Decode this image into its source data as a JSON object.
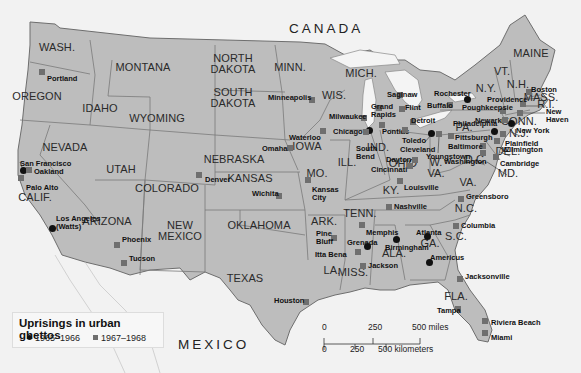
{
  "map": {
    "countries": {
      "canada": "CANADA",
      "mexico": "MEXICO"
    },
    "states": [
      {
        "id": "wash",
        "label": "WASH.",
        "x": 57,
        "y": 47
      },
      {
        "id": "oregon",
        "label": "OREGON",
        "x": 37,
        "y": 96
      },
      {
        "id": "idaho",
        "label": "IDAHO",
        "x": 100,
        "y": 108
      },
      {
        "id": "montana",
        "label": "MONTANA",
        "x": 143,
        "y": 67
      },
      {
        "id": "wyoming",
        "label": "WYOMING",
        "x": 157,
        "y": 118
      },
      {
        "id": "north-dakota",
        "label": "NORTH\nDAKOTA",
        "x": 233,
        "y": 64
      },
      {
        "id": "south-dakota",
        "label": "SOUTH\nDAKOTA",
        "x": 233,
        "y": 98
      },
      {
        "id": "minn",
        "label": "MINN.",
        "x": 290,
        "y": 67
      },
      {
        "id": "wis",
        "label": "WIS.",
        "x": 334,
        "y": 95
      },
      {
        "id": "mich",
        "label": "MICH.",
        "x": 361,
        "y": 73
      },
      {
        "id": "nevada",
        "label": "NEVADA",
        "x": 65,
        "y": 147
      },
      {
        "id": "utah",
        "label": "UTAH",
        "x": 121,
        "y": 169
      },
      {
        "id": "colorado",
        "label": "COLORADO",
        "x": 167,
        "y": 188
      },
      {
        "id": "nebraska",
        "label": "NEBRASKA",
        "x": 234,
        "y": 159
      },
      {
        "id": "iowa",
        "label": "IOWA",
        "x": 307,
        "y": 146
      },
      {
        "id": "kansas",
        "label": "KANSAS",
        "x": 250,
        "y": 178
      },
      {
        "id": "mo",
        "label": "MO.",
        "x": 317,
        "y": 173
      },
      {
        "id": "ill",
        "label": "ILL.",
        "x": 347,
        "y": 162
      },
      {
        "id": "ind",
        "label": "IND.",
        "x": 378,
        "y": 147
      },
      {
        "id": "ohio",
        "label": "OHIO",
        "x": 403,
        "y": 163
      },
      {
        "id": "calif",
        "label": "CALIF.",
        "x": 35,
        "y": 197
      },
      {
        "id": "arizona",
        "label": "ARIZONA",
        "x": 107,
        "y": 221
      },
      {
        "id": "new-mexico",
        "label": "NEW\nMEXICO",
        "x": 180,
        "y": 231
      },
      {
        "id": "oklahoma",
        "label": "OKLAHOMA",
        "x": 259,
        "y": 225
      },
      {
        "id": "texas",
        "label": "TEXAS",
        "x": 245,
        "y": 278
      },
      {
        "id": "ark",
        "label": "ARK.",
        "x": 324,
        "y": 221
      },
      {
        "id": "la",
        "label": "LA.",
        "x": 332,
        "y": 270
      },
      {
        "id": "miss",
        "label": "MISS.",
        "x": 353,
        "y": 272
      },
      {
        "id": "tenn",
        "label": "TENN.",
        "x": 360,
        "y": 213
      },
      {
        "id": "ala",
        "label": "ALA.",
        "x": 394,
        "y": 253
      },
      {
        "id": "ga",
        "label": "GA.",
        "x": 430,
        "y": 243
      },
      {
        "id": "ky",
        "label": "KY.",
        "x": 391,
        "y": 190
      },
      {
        "id": "w-va",
        "label": "W.\nVA.",
        "x": 436,
        "y": 168
      },
      {
        "id": "va",
        "label": "VA.",
        "x": 468,
        "y": 182
      },
      {
        "id": "nc",
        "label": "N.C.",
        "x": 466,
        "y": 208
      },
      {
        "id": "sc",
        "label": "S.C.",
        "x": 456,
        "y": 236
      },
      {
        "id": "fla",
        "label": "FLA.",
        "x": 456,
        "y": 296
      },
      {
        "id": "pa",
        "label": "PA.",
        "x": 464,
        "y": 127
      },
      {
        "id": "ny",
        "label": "N.Y.",
        "x": 486,
        "y": 88
      },
      {
        "id": "vt",
        "label": "VT.",
        "x": 502,
        "y": 71
      },
      {
        "id": "nh",
        "label": "N.H.",
        "x": 518,
        "y": 84
      },
      {
        "id": "maine",
        "label": "MAINE",
        "x": 531,
        "y": 53
      },
      {
        "id": "mass",
        "label": "MASS.",
        "x": 541,
        "y": 97
      },
      {
        "id": "ri",
        "label": "R.I.",
        "x": 546,
        "y": 104
      },
      {
        "id": "conn",
        "label": "CONN.",
        "x": 519,
        "y": 121
      },
      {
        "id": "nj",
        "label": "N.J.",
        "x": 519,
        "y": 133
      },
      {
        "id": "del",
        "label": "DEL.",
        "x": 508,
        "y": 151
      },
      {
        "id": "md",
        "label": "MD.",
        "x": 508,
        "y": 173
      },
      {
        "id": "dc",
        "label": "D.C.",
        "x": 476,
        "y": 159
      }
    ],
    "cities": [
      {
        "name": "Portland",
        "period": "1967-1968",
        "mx": 42,
        "my": 72,
        "lx": 47,
        "ly": 75
      },
      {
        "name": "San Francisco",
        "period": "1965-1966",
        "mx": 23,
        "my": 170,
        "lx": 20,
        "ly": 160
      },
      {
        "name": "Oakland",
        "period": "1967-1968",
        "mx": 29,
        "my": 170,
        "lx": 34,
        "ly": 168
      },
      {
        "name": "Palo Alto",
        "period": "1967-1968",
        "mx": 21,
        "my": 178,
        "lx": 26,
        "ly": 184
      },
      {
        "name": "Los Angeles\n(Watts)",
        "period": "1965-1966",
        "mx": 52,
        "my": 228,
        "lx": 56,
        "ly": 215
      },
      {
        "name": "Phoenix",
        "period": "1967-1968",
        "mx": 117,
        "my": 245,
        "lx": 122,
        "ly": 236
      },
      {
        "name": "Tucson",
        "period": "1967-1968",
        "mx": 124,
        "my": 263,
        "lx": 129,
        "ly": 255
      },
      {
        "name": "Denver",
        "period": "1967-1968",
        "mx": 199,
        "my": 175,
        "lx": 205,
        "ly": 176
      },
      {
        "name": "Wichita",
        "period": "1967-1968",
        "mx": 279,
        "my": 196,
        "lx": 252,
        "ly": 190
      },
      {
        "name": "Omaha",
        "period": "1967-1968",
        "mx": 290,
        "my": 148,
        "lx": 262,
        "ly": 145
      },
      {
        "name": "Waterloo",
        "period": "1967-1968",
        "mx": 323,
        "my": 131,
        "lx": 289,
        "ly": 134
      },
      {
        "name": "Kansas\nCity",
        "period": "1967-1968",
        "mx": 308,
        "my": 180,
        "lx": 312,
        "ly": 186
      },
      {
        "name": "Minneapolis",
        "period": "1967-1968",
        "mx": 312,
        "my": 100,
        "lx": 268,
        "ly": 94
      },
      {
        "name": "Milwaukee",
        "period": "1967-1968",
        "mx": 364,
        "my": 118,
        "lx": 329,
        "ly": 113
      },
      {
        "name": "Chicago",
        "period": "1965-1966",
        "mx": 369,
        "my": 130,
        "lx": 333,
        "ly": 128
      },
      {
        "name": "South\nBend",
        "period": "1967-1968",
        "mx": 366,
        "my": 132,
        "lx": 356,
        "ly": 145
      },
      {
        "name": "Grand\nRapids",
        "period": "1967-1968",
        "mx": 379,
        "my": 108,
        "lx": 371,
        "ly": 103
      },
      {
        "name": "Saginaw",
        "period": "1967-1968",
        "mx": 400,
        "my": 95,
        "lx": 387,
        "ly": 91
      },
      {
        "name": "Flint",
        "period": "1967-1968",
        "mx": 402,
        "my": 109,
        "lx": 405,
        "ly": 104
      },
      {
        "name": "Pontiac",
        "period": "1967-1968",
        "mx": 382,
        "my": 125,
        "lx": 382,
        "ly": 128
      },
      {
        "name": "Detroit",
        "period": "1967-1968",
        "mx": 413,
        "my": 122,
        "lx": 411,
        "ly": 117
      },
      {
        "name": "Toledo",
        "period": "1967-1968",
        "mx": 405,
        "my": 130,
        "lx": 402,
        "ly": 137
      },
      {
        "name": "Cleveland",
        "period": "1965-1966",
        "mx": 431,
        "my": 133,
        "lx": 400,
        "ly": 146
      },
      {
        "name": "Youngstown",
        "period": "1967-1968",
        "mx": 439,
        "my": 134,
        "lx": 426,
        "ly": 153
      },
      {
        "name": "Dayton",
        "period": "1967-1968",
        "mx": 415,
        "my": 160,
        "lx": 386,
        "ly": 156
      },
      {
        "name": "Cincinnati",
        "period": "1967-1968",
        "mx": 410,
        "my": 166,
        "lx": 371,
        "ly": 166
      },
      {
        "name": "Louisville",
        "period": "1967-1968",
        "mx": 400,
        "my": 181,
        "lx": 404,
        "ly": 184
      },
      {
        "name": "Nashville",
        "period": "1967-1968",
        "mx": 389,
        "my": 207,
        "lx": 394,
        "ly": 203
      },
      {
        "name": "Memphis",
        "period": "1967-1968",
        "mx": 362,
        "my": 225,
        "lx": 366,
        "ly": 229
      },
      {
        "name": "Grenada",
        "period": "1965-1966",
        "mx": 367,
        "my": 246,
        "lx": 347,
        "ly": 239
      },
      {
        "name": "Pine\nBluff",
        "period": "1967-1968",
        "mx": 334,
        "my": 238,
        "lx": 316,
        "ly": 230
      },
      {
        "name": "Itta Bena",
        "period": "1967-1968",
        "mx": 358,
        "my": 252,
        "lx": 315,
        "ly": 251
      },
      {
        "name": "Jackson",
        "period": "1967-1968",
        "mx": 363,
        "my": 266,
        "lx": 368,
        "ly": 262
      },
      {
        "name": "Birmingham",
        "period": "1965-1966",
        "mx": 396,
        "my": 239,
        "lx": 385,
        "ly": 244
      },
      {
        "name": "Atlanta",
        "period": "1965-1966",
        "mx": 427,
        "my": 236,
        "lx": 416,
        "ly": 229
      },
      {
        "name": "Americus",
        "period": "1965-1966",
        "mx": 429,
        "my": 262,
        "lx": 430,
        "ly": 254
      },
      {
        "name": "Columbia",
        "period": "1967-1968",
        "mx": 456,
        "my": 226,
        "lx": 461,
        "ly": 222
      },
      {
        "name": "Greensboro",
        "period": "1967-1968",
        "mx": 461,
        "my": 199,
        "lx": 466,
        "ly": 193
      },
      {
        "name": "Jacksonville",
        "period": "1967-1968",
        "mx": 460,
        "my": 279,
        "lx": 465,
        "ly": 273
      },
      {
        "name": "Tampa",
        "period": "1967-1968",
        "mx": 458,
        "my": 309,
        "lx": 437,
        "ly": 307
      },
      {
        "name": "Riviera Beach",
        "period": "1967-1968",
        "mx": 485,
        "my": 321,
        "lx": 491,
        "ly": 319
      },
      {
        "name": "Miami",
        "period": "1967-1968",
        "mx": 485,
        "my": 333,
        "lx": 491,
        "ly": 334
      },
      {
        "name": "Houston",
        "period": "1967-1968",
        "mx": 306,
        "my": 302,
        "lx": 274,
        "ly": 297
      },
      {
        "name": "Rochester",
        "period": "1965-1966",
        "mx": 467,
        "my": 99,
        "lx": 434,
        "ly": 90
      },
      {
        "name": "Buffalo",
        "period": "1967-1968",
        "mx": 450,
        "my": 105,
        "lx": 427,
        "ly": 102
      },
      {
        "name": "Poughkeepsie",
        "period": "1967-1968",
        "mx": 503,
        "my": 111,
        "lx": 462,
        "ly": 104
      },
      {
        "name": "Providence",
        "period": "1967-1968",
        "mx": 523,
        "my": 104,
        "lx": 487,
        "ly": 96
      },
      {
        "name": "Boston",
        "period": "1967-1968",
        "mx": 529,
        "my": 92,
        "lx": 531,
        "ly": 86
      },
      {
        "name": "New\nHaven",
        "period": "1967-1968",
        "mx": 520,
        "my": 113,
        "lx": 546,
        "ly": 108
      },
      {
        "name": "Newark",
        "period": "1967-1968",
        "mx": 505,
        "my": 120,
        "lx": 475,
        "ly": 117
      },
      {
        "name": "New York",
        "period": "1965-1966",
        "mx": 511,
        "my": 123,
        "lx": 516,
        "ly": 127
      },
      {
        "name": "Philadelphia",
        "period": "1965-1966",
        "mx": 494,
        "my": 131,
        "lx": 453,
        "ly": 120
      },
      {
        "name": "Plainfield",
        "period": "1967-1968",
        "mx": 503,
        "my": 134,
        "lx": 505,
        "ly": 140
      },
      {
        "name": "Pittsburgh",
        "period": "1967-1968",
        "mx": 451,
        "my": 136,
        "lx": 455,
        "ly": 134
      },
      {
        "name": "Baltimore",
        "period": "1967-1968",
        "mx": 483,
        "my": 146,
        "lx": 448,
        "ly": 143
      },
      {
        "name": "Wilmington",
        "period": "1967-1968",
        "mx": 497,
        "my": 141,
        "lx": 502,
        "ly": 146
      },
      {
        "name": "Washington",
        "period": "1967-1968",
        "mx": 483,
        "my": 153,
        "lx": 444,
        "ly": 158
      },
      {
        "name": "Cambridge",
        "period": "1967-1968",
        "mx": 496,
        "my": 157,
        "lx": 500,
        "ly": 160
      }
    ]
  },
  "legend": {
    "title": "Uprisings in urban ghettos",
    "items": [
      {
        "symbol": "circle",
        "label": "1965–1966",
        "color": "#111111"
      },
      {
        "symbol": "square",
        "label": "1967–1968",
        "color": "#6f6f6f"
      }
    ]
  },
  "scale": {
    "miles": {
      "ticks": [
        "0",
        "250",
        "500 miles"
      ]
    },
    "kilometers": {
      "ticks": [
        "0",
        "250",
        "500 kilometers"
      ]
    }
  },
  "colors": {
    "land_us": "#bdbdbd",
    "land_outside": "#f2f2f2",
    "water": "#f8f8f8",
    "border": "#7a7a7a",
    "circle_marker": "#111111",
    "square_marker": "#6f6f6f"
  }
}
